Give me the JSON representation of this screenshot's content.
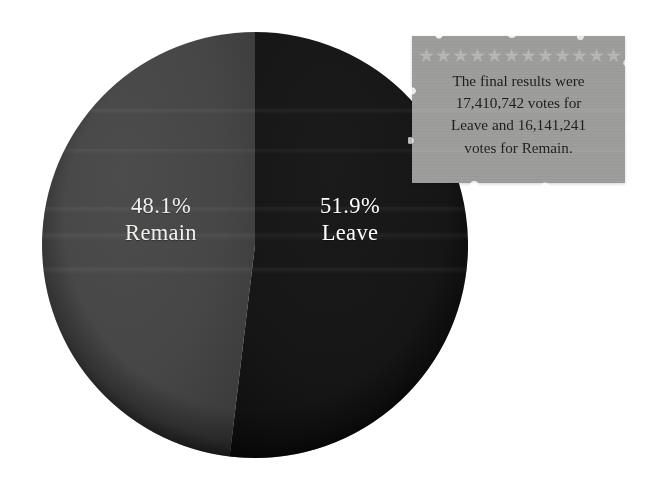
{
  "image": {
    "title": "EU Referendum result pie chart with paper note",
    "background_color": "#ffffff",
    "width": 647,
    "height": 487
  },
  "chart_data": {
    "type": "pie",
    "title": "",
    "categories": [
      "Remain",
      "Leave"
    ],
    "values": [
      48.1,
      51.9
    ],
    "value_unit": "%",
    "labels": [
      "48.1%",
      "51.9%"
    ],
    "colors": [
      "#454545",
      "#151515"
    ],
    "votes": {
      "Leave": "17,410,742",
      "Remain": "16,141,241"
    },
    "legend": "none",
    "grid": false,
    "start_angle_deg": 0,
    "direction": "clockwise",
    "slices": [
      {
        "name": "Leave",
        "percent_label": "51.9%",
        "value": 51.9,
        "color": "#151515",
        "side": "right"
      },
      {
        "name": "Remain",
        "percent_label": "48.1%",
        "value": 48.1,
        "color": "#454545",
        "side": "left"
      }
    ]
  },
  "pie": {
    "remain": {
      "percent": "48.1%",
      "name": "Remain",
      "color": "#454545"
    },
    "leave": {
      "percent": "51.9%",
      "name": "Leave",
      "color": "#151515"
    }
  },
  "note": {
    "background_color": "#9c9c9a",
    "star_color": "#b6b6b3",
    "star_glyph": "★",
    "star_count": 12,
    "text_line_1": "The final results were",
    "text_line_2": "17,410,742 votes for",
    "text_line_3": "Leave and 16,141,241",
    "text_line_4": "votes for Remain.",
    "full_text": "The final results were 17,410,742 votes for Leave and 16,141,241 votes for Remain."
  }
}
